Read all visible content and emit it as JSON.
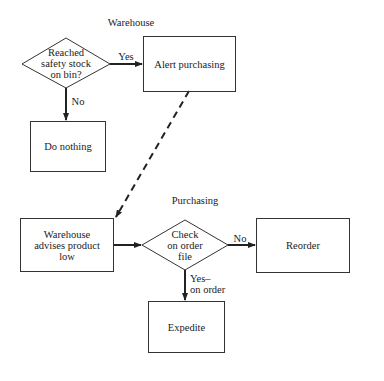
{
  "sections": {
    "warehouse": "Warehouse",
    "purchasing": "Purchasing"
  },
  "nodes": {
    "decision_safety_stock": "Reached\nsafety stock\non bin?",
    "alert_purchasing": "Alert purchasing",
    "do_nothing": "Do nothing",
    "warehouse_advises": "Warehouse\nadvises product\nlow",
    "decision_order_file": "Check\non order\nfile",
    "reorder": "Reorder",
    "expedite": "Expedite"
  },
  "edges": {
    "yes": "Yes",
    "no": "No",
    "no2": "No",
    "yes_on_order": "Yes–\non order"
  }
}
